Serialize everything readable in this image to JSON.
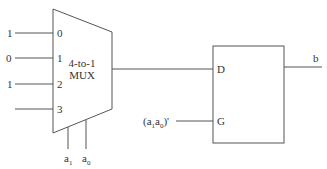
{
  "diagram": {
    "mux": {
      "label_line1": "4-to-1",
      "label_line2": "MUX",
      "inputs": [
        {
          "index": "0",
          "value": "1"
        },
        {
          "index": "1",
          "value": "0"
        },
        {
          "index": "2",
          "value": "1"
        },
        {
          "index": "3",
          "value": ""
        }
      ],
      "selects": [
        {
          "base": "a",
          "sub": "1"
        },
        {
          "base": "a",
          "sub": "0"
        }
      ]
    },
    "latch": {
      "d_label": "D",
      "g_label": "G",
      "output_label": "b",
      "g_input": {
        "open": "(a",
        "sub1": "1",
        "mid": "a",
        "sub0": "0",
        "close": ")'"
      }
    }
  }
}
